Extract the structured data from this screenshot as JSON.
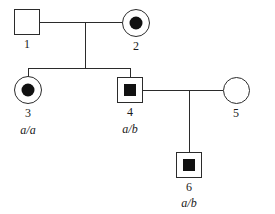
{
  "diagram": {
    "type": "pedigree-chart",
    "canvas": {
      "width": 275,
      "height": 214,
      "background": "#ffffff"
    },
    "line_color": "#2b2b2b",
    "fill_color": "#111111"
  },
  "individuals": [
    {
      "id": "1",
      "sex": "male",
      "shape": "square",
      "fill": "unaffected",
      "inner_marker": "none",
      "genotype": "",
      "generation": "I",
      "x": 14,
      "y": 9,
      "w": 26,
      "h": 26
    },
    {
      "id": "2",
      "sex": "female",
      "shape": "circle",
      "fill": "affected-dot",
      "inner_marker": "dot",
      "genotype": "",
      "generation": "I",
      "x": 122,
      "y": 9,
      "w": 28,
      "h": 28
    },
    {
      "id": "3",
      "sex": "female",
      "shape": "circle",
      "fill": "affected-dot",
      "inner_marker": "dot",
      "genotype": "a/a",
      "generation": "II",
      "x": 14,
      "y": 76,
      "w": 28,
      "h": 28
    },
    {
      "id": "4",
      "sex": "male",
      "shape": "square",
      "fill": "affected-box",
      "inner_marker": "box",
      "genotype": "a/b",
      "generation": "II",
      "x": 117,
      "y": 77,
      "w": 26,
      "h": 26
    },
    {
      "id": "5",
      "sex": "female",
      "shape": "circle",
      "fill": "unaffected",
      "inner_marker": "none",
      "genotype": "",
      "generation": "II",
      "x": 223,
      "y": 77,
      "w": 27,
      "h": 27
    },
    {
      "id": "6",
      "sex": "male",
      "shape": "square",
      "fill": "affected-box",
      "inner_marker": "box",
      "genotype": "a/b",
      "generation": "III",
      "x": 176,
      "y": 152,
      "w": 26,
      "h": 26
    }
  ],
  "connectors": {
    "mating_line_1": {
      "label": "mating-line-1-2",
      "x": 40,
      "y": 22,
      "length": 82
    },
    "sibship_drop_1": {
      "label": "sibship-drop-gen1",
      "x": 85,
      "y": 22,
      "length": 46
    },
    "sibship_bar_1": {
      "label": "sibship-bar-gen2",
      "x": 28,
      "y": 68,
      "length": 102
    },
    "child_drop_3": {
      "label": "child-drop-3",
      "x": 28,
      "y": 68,
      "length": 8
    },
    "child_drop_4": {
      "label": "child-drop-4",
      "x": 130,
      "y": 68,
      "length": 9
    },
    "mating_line_2": {
      "label": "mating-line-4-5",
      "x": 143,
      "y": 90,
      "length": 80
    },
    "sibship_drop_2": {
      "label": "sibship-drop-gen2",
      "x": 189,
      "y": 90,
      "length": 62
    }
  }
}
